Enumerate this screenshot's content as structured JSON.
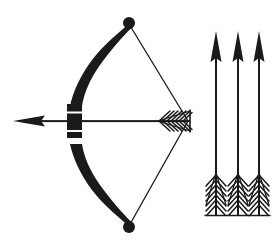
{
  "canvas": {
    "width": 276,
    "height": 242,
    "background_color": "#ffffff",
    "ink_color": "#1a1a1a",
    "title": "Archery bow with nocked arrow and three loose arrows",
    "style": "black silhouette clip-art line illustration"
  },
  "figure": {
    "name": "bow-and-arrow-illustration",
    "subjects": [
      "recurve bow drawn with bowstring",
      "nocked arrow pointing left",
      "three upright arrows pointing up"
    ]
  },
  "bow": {
    "name": "bow",
    "orientation": "vertical, belly facing right",
    "color": "#1a1a1a",
    "upper_limb": {
      "name": "upper-limb",
      "tip_x": 128,
      "tip_y": 22,
      "belly_x": 68,
      "belly_y": 105
    },
    "lower_limb": {
      "name": "lower-limb",
      "tip_x": 128,
      "tip_y": 228,
      "belly_x": 68,
      "belly_y": 137
    },
    "upper_tip_knob": {
      "cx": 129,
      "cy": 23,
      "r": 6
    },
    "lower_tip_knob": {
      "cx": 129,
      "cy": 227,
      "r": 6
    },
    "grip": {
      "name": "grip",
      "x": 67,
      "y": 105,
      "width": 15,
      "height": 32,
      "separator_color": "#ffffff",
      "separator_top_y": 112,
      "separator_bottom_y": 131
    },
    "string": {
      "name": "bowstring",
      "color": "#1a1a1a",
      "width": 1,
      "anchor_x": 188,
      "anchor_y": 121,
      "top_x": 129,
      "top_y": 24,
      "bottom_x": 129,
      "bottom_y": 226
    }
  },
  "nocked_arrow": {
    "name": "nocked-arrow",
    "direction": "left",
    "color": "#1a1a1a",
    "shaft": {
      "x1": 22,
      "x2": 190,
      "y": 121,
      "thickness": 2
    },
    "head": {
      "name": "arrowhead-left",
      "tip_x": 14,
      "tip_y": 121,
      "base_x": 44,
      "half_height": 6
    },
    "fletching": {
      "name": "fletching-horizontal",
      "start_x": 158,
      "end_x": 190,
      "half_height": 11,
      "barb_count": 9,
      "pattern": "herringbone"
    }
  },
  "loose_arrows": {
    "name": "loose-arrow-group",
    "count": 3,
    "direction": "up",
    "color": "#1a1a1a",
    "items": [
      {
        "name": "loose-arrow-1",
        "shaft_x": 216,
        "tip_y": 32,
        "nock_y": 216
      },
      {
        "name": "loose-arrow-2",
        "shaft_x": 238,
        "tip_y": 32,
        "nock_y": 216
      },
      {
        "name": "loose-arrow-3",
        "shaft_x": 259,
        "tip_y": 32,
        "nock_y": 216
      }
    ],
    "shaft_thickness": 2,
    "head": {
      "name": "arrowhead-up",
      "length": 28,
      "half_width": 6
    },
    "fletching": {
      "name": "fletching-vertical",
      "top_y": 173,
      "bottom_y": 216,
      "half_width": 11,
      "barb_count": 9,
      "pattern": "herringbone"
    }
  }
}
